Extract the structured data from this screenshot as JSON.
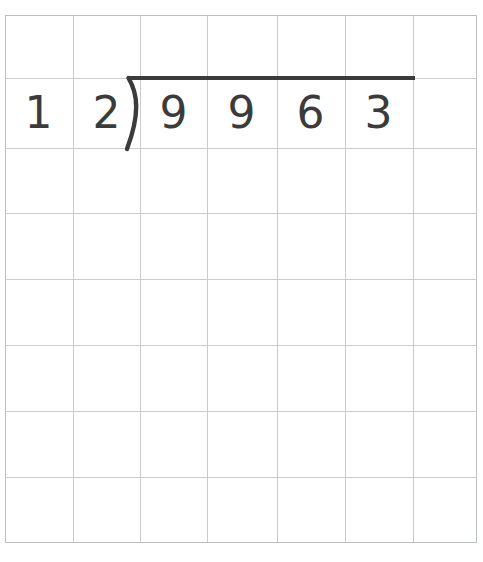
{
  "worksheet": {
    "type": "long-division-grid",
    "background_color": "#ffffff",
    "grid": {
      "columns": 7,
      "rows": 8,
      "left": 5,
      "top": 15,
      "cell_width": 67,
      "cell_height": 66,
      "line_color": "#c9cbcd",
      "border_color": "#bcbfc2",
      "line_width": 1
    },
    "problem": {
      "operation": "division",
      "divisor": "12",
      "dividend": "9963",
      "quotient": "",
      "ink_color": "#3b3b3b",
      "overbar": {
        "x_start": 130,
        "x_end": 415,
        "y": 78,
        "thickness": 4
      },
      "bracket": {
        "x": 127,
        "y_top": 78,
        "y_bottom": 148,
        "thickness": 4
      }
    },
    "cells": {
      "divisor_digits": [
        {
          "label": "1",
          "col": 0,
          "row": 1
        },
        {
          "label": "2",
          "col": 1,
          "row": 1
        }
      ],
      "dividend_digits": [
        {
          "label": "9",
          "col": 2,
          "row": 1
        },
        {
          "label": "9",
          "col": 3,
          "row": 1
        },
        {
          "label": "6",
          "col": 4,
          "row": 1
        },
        {
          "label": "3",
          "col": 5,
          "row": 1
        }
      ]
    }
  }
}
